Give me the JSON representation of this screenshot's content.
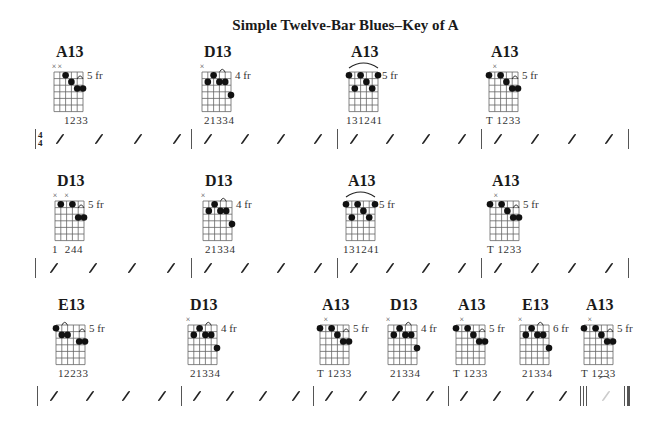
{
  "title": "Simple Twelve-Bar Blues–Key of A",
  "time_signature": {
    "top": "4",
    "bottom": "4"
  },
  "rows": [
    {
      "chords": [
        {
          "name": "A13",
          "fret": "5 fr",
          "fingers": "1233",
          "muted": [
            0,
            1
          ]
        },
        {
          "name": "D13",
          "fret": "4 fr",
          "fingers": "21334",
          "muted": [
            0
          ]
        },
        {
          "name": "A13",
          "fret": "5 fr",
          "fingers": "131241",
          "muted": []
        },
        {
          "name": "A13",
          "fret": "5 fr",
          "fingers": "T 1233",
          "muted": [
            1
          ]
        }
      ],
      "slash_label": "/"
    },
    {
      "chords": [
        {
          "name": "D13",
          "fret": "5 fr",
          "fingers": "1  244",
          "muted": [
            0,
            2
          ]
        },
        {
          "name": "D13",
          "fret": "4 fr",
          "fingers": "21334",
          "muted": [
            0
          ]
        },
        {
          "name": "A13",
          "fret": "5 fr",
          "fingers": "131241",
          "muted": []
        },
        {
          "name": "A13",
          "fret": "5 fr",
          "fingers": "T 1233",
          "muted": [
            1
          ]
        }
      ]
    },
    {
      "chords": [
        {
          "name": "E13",
          "fret": "5 fr",
          "fingers": "12233",
          "muted": []
        },
        {
          "name": "D13",
          "fret": "4 fr",
          "fingers": "21334",
          "muted": [
            0
          ]
        },
        {
          "name": "A13",
          "fret": "5 fr",
          "fingers": "T 1233",
          "muted": [
            1
          ]
        },
        {
          "name": "D13",
          "fret": "4 fr",
          "fingers": "21334",
          "muted": [
            0
          ]
        },
        {
          "name": "A13",
          "fret": "5 fr",
          "fingers": "T 1233",
          "muted": [
            1
          ]
        },
        {
          "name": "E13",
          "fret": "6 fr",
          "fingers": "21334",
          "muted": [
            0
          ]
        },
        {
          "name": "A13",
          "fret": "5 fr",
          "fingers": "T 1233",
          "muted": [
            1
          ]
        }
      ]
    }
  ],
  "muted_symbol": "×",
  "fermata_symbol": "𝄐"
}
